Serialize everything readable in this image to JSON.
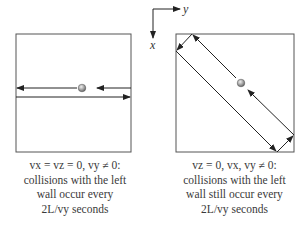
{
  "axes": {
    "x_label": "x",
    "y_label": "y"
  },
  "panels": [
    {
      "id": "left",
      "description": "particle moving horizontally between left and right walls",
      "caption": {
        "line1": "vx = vz = 0, vy ≠ 0:",
        "line2": "collisions with the left",
        "line3": "wall occur every",
        "line4": "2L/vy seconds"
      }
    },
    {
      "id": "right",
      "description": "particle moving diagonally, bouncing off walls",
      "caption": {
        "line1": "vz = 0, vx, vy ≠ 0:",
        "line2": "collisions with the left",
        "line3": "wall still occur every",
        "line4": "2L/vy seconds"
      }
    }
  ],
  "colors": {
    "stroke": "#333333",
    "box": "#555555",
    "ball": "#999999",
    "text": "#3a3a3a"
  }
}
